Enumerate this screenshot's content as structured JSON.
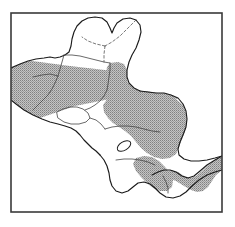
{
  "figure": {
    "type": "distribution-range-map",
    "title": "",
    "caption": "",
    "region_name": "Central America",
    "projection_note": "",
    "frame": {
      "x": 11,
      "y": 13,
      "width": 211,
      "height": 199,
      "stroke_color": "#3a3a3a",
      "stroke_width": 1.6,
      "fill_color": "#ffffff"
    },
    "legend": {
      "visible": false,
      "entries": [
        {
          "label": "Distribution range",
          "swatch": "#a8a8a8",
          "pattern": "stipple-crosshatch"
        },
        {
          "label": "Outside range",
          "swatch": "#ffffff",
          "pattern": "none"
        }
      ]
    },
    "style": {
      "land_outline_color": "#1b1b1b",
      "land_outline_width": 1.15,
      "internal_border_color": "#444444",
      "internal_border_width": 0.8,
      "dashed_border_color": "#555555",
      "range_fill_color": "#a6a6a6",
      "range_pattern": "stipple-crosshatch",
      "range_pattern_spacing_px": 2,
      "water_color": "#ffffff",
      "lake_color": "#ffffff"
    },
    "features": {
      "shaded_range_bands": [
        {
          "name": "northern-range-band",
          "note": "broad shaded band across southern Mexico, Belize, northern Guatemala and Honduras",
          "path": "M 11,81 L 11,125 L 30,115 L 52,104 L 74,96 L 96,92 L 118,90 L 140,92 L 158,96 L 170,100 L 174,92 L 168,84 L 150,80 L 128,77 L 104,75 L 80,74 L 56,76 L 32,79 Z"
        }
      ],
      "lakes": [
        {
          "name": "lake-nicaragua",
          "cx": 124,
          "cy": 146,
          "rx": 7.5,
          "ry": 4.2,
          "rotation": -32
        }
      ]
    }
  },
  "chart_data": {
    "type": "map",
    "xlabel": "",
    "ylabel": "",
    "legend_position": "none",
    "grid": false,
    "regions": [
      {
        "name": "Mexico (Chiapas / Tabasco / Veracruz)",
        "shaded": true,
        "partial": true
      },
      {
        "name": "Yucatan Peninsula (Yucatan / Quintana Roo / Campeche)",
        "shaded": false,
        "partial": false
      },
      {
        "name": "Belize",
        "shaded": true,
        "partial": true
      },
      {
        "name": "Guatemala (Peten / northern lowlands)",
        "shaded": true,
        "partial": true
      },
      {
        "name": "Guatemala (Pacific highlands)",
        "shaded": false,
        "partial": false
      },
      {
        "name": "El Salvador",
        "shaded": false,
        "partial": false
      },
      {
        "name": "Honduras",
        "shaded": true,
        "partial": false
      },
      {
        "name": "Nicaragua",
        "shaded": true,
        "partial": false
      },
      {
        "name": "Costa Rica",
        "shaded": true,
        "partial": false
      },
      {
        "name": "Panama",
        "shaded": true,
        "partial": false
      }
    ],
    "shaded_fraction_note": "Shaded stipple denotes the species distribution range; white land denotes land outside the range."
  }
}
